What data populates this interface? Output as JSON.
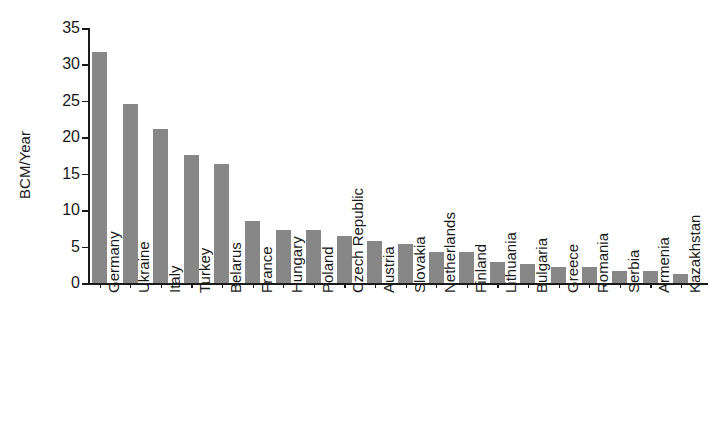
{
  "chart_data": {
    "type": "bar",
    "title": "",
    "xlabel": "",
    "ylabel": "BCM/Year",
    "ylim": [
      0,
      35
    ],
    "yticks": [
      0,
      5,
      10,
      15,
      20,
      25,
      30,
      35
    ],
    "ytick_labels": [
      "0",
      "5",
      "10",
      "15",
      "20",
      "25",
      "30",
      "35"
    ],
    "grid": false,
    "legend": null,
    "bar_color": "#878787",
    "axis_color": "#1a1a1a",
    "categories": [
      "Germany",
      "Ukraine",
      "Italy",
      "Turkey",
      "Belarus",
      "France",
      "Hungary",
      "Poland",
      "Czech Republic",
      "Austria",
      "Slovakia",
      "Netherlands",
      "Finland",
      "Lithuania",
      "Bulgaria",
      "Greece",
      "Romania",
      "Serbia",
      "Armenia",
      "Kazakhstan"
    ],
    "values": [
      31.7,
      24.6,
      21.2,
      17.6,
      16.3,
      8.5,
      7.3,
      7.3,
      6.5,
      5.7,
      5.3,
      4.3,
      4.2,
      2.9,
      2.6,
      2.2,
      2.2,
      1.7,
      1.7,
      1.3
    ]
  }
}
